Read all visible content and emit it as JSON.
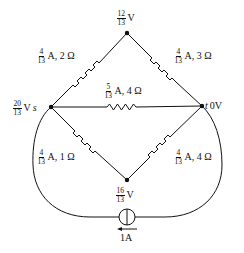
{
  "diagram": {
    "type": "circuit",
    "nodes": {
      "top": {
        "voltage_num": "12",
        "voltage_den": "13",
        "unit": "V"
      },
      "s": {
        "name": "s",
        "voltage_num": "20",
        "voltage_den": "13",
        "unit": "V"
      },
      "t": {
        "name": "t",
        "voltage_text": "0V"
      },
      "bottom": {
        "voltage_num": "16",
        "voltage_den": "13",
        "unit": "V"
      }
    },
    "edges": {
      "s_top": {
        "current_num": "4",
        "current_den": "13",
        "rest": "A, 2 Ω"
      },
      "top_t": {
        "current_num": "4",
        "current_den": "13",
        "rest": "A, 3 Ω"
      },
      "s_t": {
        "current_num": "5",
        "current_den": "13",
        "rest": "A, 4 Ω"
      },
      "s_bottom": {
        "current_num": "4",
        "current_den": "13",
        "rest": "A, 1 Ω"
      },
      "bottom_t": {
        "current_num": "4",
        "current_den": "13",
        "rest": "A, 4 Ω"
      }
    },
    "source": {
      "label": "1A",
      "direction": "left"
    },
    "colors": {
      "line": "#111111",
      "background": "#ffffff"
    }
  }
}
